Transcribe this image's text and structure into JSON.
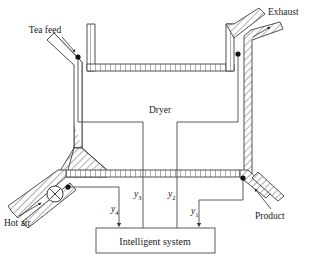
{
  "diagram": {
    "colors": {
      "wall_stroke": "#3c3c3c",
      "signal_line": "#4a4a4a",
      "text": "#1a1a1a",
      "sensor_dot": "#111111",
      "background": "#ffffff"
    },
    "labels": {
      "tea_feed": "Tea feed",
      "exhaust": "Exhaust",
      "dryer": "Dryer",
      "hot_air": "Hot air",
      "product": "Product",
      "intelligent_system": "Intelligent system"
    },
    "signals": [
      {
        "id": "y1",
        "base": "y",
        "sub": "1",
        "source": "product-sensor"
      },
      {
        "id": "y2",
        "base": "y",
        "sub": "2",
        "source": "exhaust-sensor"
      },
      {
        "id": "y3",
        "base": "y",
        "sub": "3",
        "source": "tea-feed-sensor"
      },
      {
        "id": "y4",
        "base": "y",
        "sub": "4",
        "source": "hot-air-sensor"
      }
    ],
    "sensors": [
      {
        "name": "tea-feed-sensor",
        "x": 78,
        "y": 57
      },
      {
        "name": "exhaust-sensor",
        "x": 238,
        "y": 54
      },
      {
        "name": "hot-air-sensor",
        "x": 68,
        "y": 187
      },
      {
        "name": "product-sensor",
        "x": 243,
        "y": 178
      }
    ],
    "equipment": {
      "fan": "fan-blower-symbol"
    }
  }
}
